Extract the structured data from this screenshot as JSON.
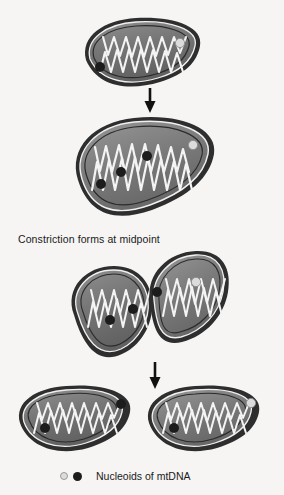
{
  "figure": {
    "background_color": "#f6f5f3",
    "caption_constriction": "Constriction forms at midpoint",
    "legend": {
      "marker_light_name": "light-nucleoid-marker",
      "marker_dark_name": "dark-nucleoid-marker",
      "label": "Nucleoids of mtDNA"
    },
    "colors": {
      "outer_membrane": "#2b2b2b",
      "matrix_dark": "#6e6e6e",
      "matrix_light": "#9a9a9a",
      "cristae_line": "#f2f2f2",
      "nucleoid_dark": "#1c1c1c",
      "nucleoid_light": "#dcdcdc",
      "arrow": "#111111"
    },
    "stages": [
      {
        "id": "stage-1",
        "name": "parent-mitochondrion",
        "label": "Parent mitochondrion",
        "nucleoids": [
          {
            "type": "dark",
            "x": 100,
            "y": 67
          },
          {
            "type": "light",
            "x": 180,
            "y": 43
          }
        ]
      },
      {
        "id": "stage-2",
        "name": "elongated-mitochondrion",
        "label": "Elongated mitochondrion with replicated nucleoids",
        "nucleoids": [
          {
            "type": "dark",
            "x": 101,
            "y": 184
          },
          {
            "type": "dark",
            "x": 118,
            "y": 172
          },
          {
            "type": "dark",
            "x": 144,
            "y": 156
          },
          {
            "type": "light",
            "x": 193,
            "y": 145
          }
        ]
      },
      {
        "id": "stage-3",
        "name": "constricted-mitochondrion",
        "label": "Constricted mitochondrion",
        "nucleoids": [
          {
            "type": "dark",
            "x": 110,
            "y": 320
          },
          {
            "type": "dark",
            "x": 133,
            "y": 309
          },
          {
            "type": "dark",
            "x": 155,
            "y": 292
          },
          {
            "type": "light",
            "x": 196,
            "y": 282
          }
        ]
      },
      {
        "id": "stage-4a",
        "name": "daughter-mitochondrion-left",
        "label": "Daughter mitochondrion (left)",
        "nucleoids": [
          {
            "type": "dark",
            "x": 45,
            "y": 428
          },
          {
            "type": "dark",
            "x": 121,
            "y": 404
          }
        ]
      },
      {
        "id": "stage-4b",
        "name": "daughter-mitochondrion-right",
        "label": "Daughter mitochondrion (right)",
        "nucleoids": [
          {
            "type": "dark",
            "x": 174,
            "y": 428
          },
          {
            "type": "light",
            "x": 251,
            "y": 403
          }
        ]
      }
    ],
    "arrows": [
      {
        "id": "arrow-1",
        "name": "division-arrow-top",
        "x": 150,
        "y1": 88,
        "y2": 112
      },
      {
        "id": "arrow-2",
        "name": "division-arrow-bottom",
        "x": 155,
        "y1": 362,
        "y2": 388
      }
    ]
  }
}
